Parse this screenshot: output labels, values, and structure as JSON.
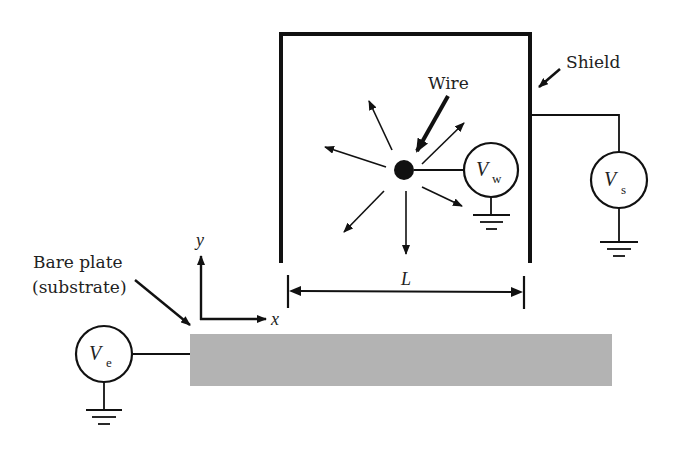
{
  "diagram": {
    "type": "electrostatic-setup-schematic",
    "labels": {
      "wire": "Wire",
      "shield": "Shield",
      "bare_plate_line1": "Bare plate",
      "bare_plate_line2": "(substrate)",
      "length": "L",
      "axis_x": "x",
      "axis_y": "y"
    },
    "sources": [
      {
        "id": "wire-source",
        "symbol": "V",
        "subscript": "w"
      },
      {
        "id": "shield-source",
        "symbol": "V",
        "subscript": "s"
      },
      {
        "id": "plate-source",
        "symbol": "V",
        "subscript": "e"
      }
    ],
    "components": {
      "shield": "open-bottom rectangular shield enclosing the wire",
      "wire": "solid dot with radial field arrows",
      "field_arrows": 6,
      "substrate": "gray rectangular bare plate",
      "grounds": 3
    },
    "colors": {
      "line": "#111111",
      "plate": "#b3b3b3",
      "background": "#ffffff"
    }
  }
}
